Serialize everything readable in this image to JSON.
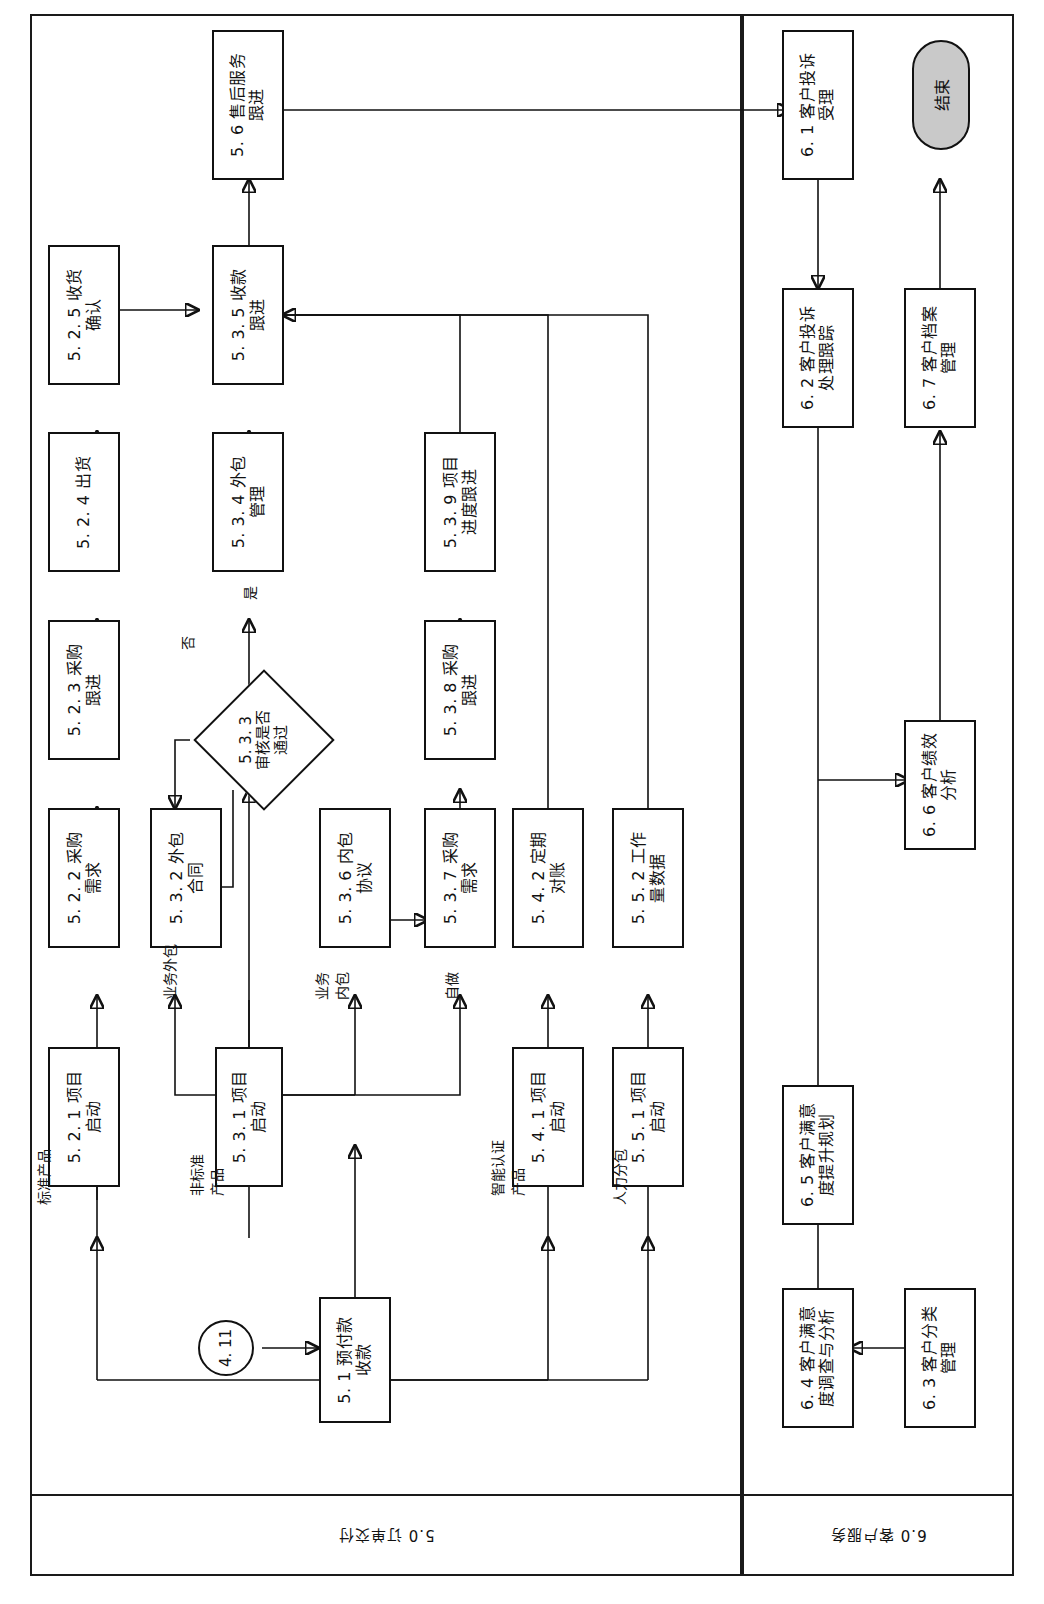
{
  "diagram": {
    "orientation": "rotated-90-ccw",
    "lanes": [
      {
        "id": "lane5",
        "label": "5.0 订单交付"
      },
      {
        "id": "lane6",
        "label": "6.0 客户服务"
      }
    ]
  },
  "nodes": {
    "n_5_6": {
      "id": "5.6",
      "line1": "5. 6  售后服务",
      "line2": "跟进"
    },
    "n_5_2_5": {
      "id": "5.2.5",
      "line1": "5. 2. 5  收货",
      "line2": "确认"
    },
    "n_5_3_5": {
      "id": "5.3.5",
      "line1": "5. 3. 5  收款",
      "line2": "跟进"
    },
    "n_5_2_4": {
      "id": "5.2.4",
      "line1": "5. 2. 4  出货",
      "line2": ""
    },
    "n_5_3_4": {
      "id": "5.3.4",
      "line1": "5. 3. 4  外包",
      "line2": "管理"
    },
    "n_5_3_9": {
      "id": "5.3.9",
      "line1": "5. 3. 9  项目",
      "line2": "进度跟进"
    },
    "n_5_2_3": {
      "id": "5.2.3",
      "line1": "5. 2. 3  采购",
      "line2": "跟进"
    },
    "n_5_3_8": {
      "id": "5.3.8",
      "line1": "5. 3. 8  采购",
      "line2": "跟进"
    },
    "n_5_3_3": {
      "id": "5.3.3",
      "line1": "5. 3. 3",
      "line2": "审核是否",
      "line3": "通过"
    },
    "n_5_2_2": {
      "id": "5.2.2",
      "line1": "5. 2. 2  采购",
      "line2": "需求"
    },
    "n_5_3_2": {
      "id": "5.3.2",
      "line1": "5. 3. 2  外包",
      "line2": "合同"
    },
    "n_5_3_6": {
      "id": "5.3.6",
      "line1": "5. 3. 6  内包",
      "line2": "协议"
    },
    "n_5_3_7": {
      "id": "5.3.7",
      "line1": "5. 3. 7  采购",
      "line2": "需求"
    },
    "n_5_4_2": {
      "id": "5.4.2",
      "line1": "5. 4. 2  定期",
      "line2": "对账"
    },
    "n_5_5_2": {
      "id": "5.5.2",
      "line1": "5. 5. 2  工作",
      "line2": "量数据"
    },
    "n_5_2_1": {
      "id": "5.2.1",
      "line1": "5. 2. 1  项目",
      "line2": "启动"
    },
    "n_5_3_1": {
      "id": "5.3.1",
      "line1": "5. 3. 1  项目",
      "line2": "启动"
    },
    "n_5_4_1": {
      "id": "5.4.1",
      "line1": "5. 4. 1  项目",
      "line2": "启动"
    },
    "n_5_5_1": {
      "id": "5.5.1",
      "line1": "5. 5. 1  项目",
      "line2": "启动"
    },
    "n_5_1": {
      "id": "5.1",
      "line1": "5. 1  预付款",
      "line2": "收款"
    },
    "n_conn": {
      "id": "4.11",
      "line1": "4. 11"
    },
    "n_6_1": {
      "id": "6.1",
      "line1": "6. 1  客户投诉",
      "line2": "受理"
    },
    "n_6_2": {
      "id": "6.2",
      "line1": "6. 2  客户投诉",
      "line2": "处理跟踪"
    },
    "n_6_7": {
      "id": "6.7",
      "line1": "6. 7  客户档案",
      "line2": "管理"
    },
    "n_6_6": {
      "id": "6.6",
      "line1": "6. 6  客户绩效",
      "line2": "分析"
    },
    "n_6_5": {
      "id": "6.5",
      "line1": "6. 5  客户满意",
      "line2": "度提升规划"
    },
    "n_6_4": {
      "id": "6.4",
      "line1": "6. 4  客户满意",
      "line2": "度调查与分析"
    },
    "n_6_3": {
      "id": "6.3",
      "line1": "6. 3  客户分类",
      "line2": "管理"
    },
    "n_end": {
      "id": "end",
      "line1": "结束"
    }
  },
  "edge_labels": {
    "std_product": "标准产品",
    "nonstd_product1": "非标准",
    "nonstd_product2": "产品",
    "smart_cert1": "智能认证",
    "smart_cert2": "产品",
    "hr_sub": "人力分包",
    "biz_out": "业务外包",
    "biz_in1": "业务",
    "biz_in2": "内包",
    "self_do": "自做",
    "yes": "是",
    "no": "否"
  },
  "colors": {
    "stroke": "#111111",
    "node_fill": "#ffffff",
    "terminator_fill": "#c9c9c9",
    "page_bg": "#ffffff"
  }
}
